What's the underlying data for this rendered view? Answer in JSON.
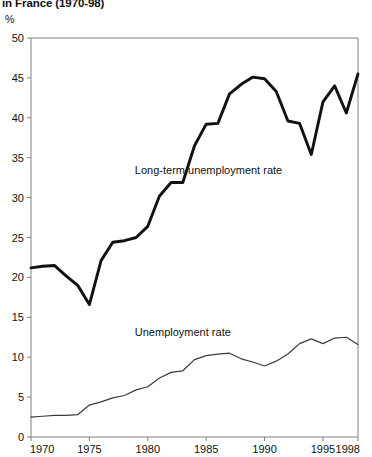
{
  "title": "in France (1970-98)",
  "axis_unit_label": "%",
  "chart_data": {
    "type": "line",
    "title": "in France (1970-98)",
    "xlabel": "",
    "ylabel": "%",
    "xlim": [
      1970,
      1998
    ],
    "ylim": [
      0,
      50
    ],
    "yticks": [
      0,
      5,
      10,
      15,
      20,
      25,
      30,
      35,
      40,
      45,
      50
    ],
    "xticks": [
      1970,
      1975,
      1980,
      1985,
      1990,
      1995,
      1998
    ],
    "xtick_labels": [
      "1970",
      "1975",
      "1980",
      "1985",
      "1990",
      "1995",
      "1998"
    ],
    "ytick_labels": [
      "0",
      "5",
      "10",
      "15",
      "20",
      "25",
      "30",
      "35",
      "40",
      "45",
      "50"
    ],
    "grid": false,
    "legend": "inline-annotations",
    "x": [
      1970,
      1971,
      1972,
      1973,
      1974,
      1975,
      1976,
      1977,
      1978,
      1979,
      1980,
      1981,
      1982,
      1983,
      1984,
      1985,
      1986,
      1987,
      1988,
      1989,
      1990,
      1991,
      1992,
      1993,
      1994,
      1995,
      1996,
      1997,
      1998
    ],
    "series": [
      {
        "name": "Long-term unemployment rate",
        "color": "#111111",
        "width": 2.9,
        "label_x": 1985.2,
        "label_y": 33.0,
        "values": [
          21.2,
          21.4,
          21.5,
          20.2,
          19.0,
          16.6,
          22.1,
          24.4,
          24.6,
          25.0,
          26.4,
          30.2,
          31.9,
          31.9,
          36.5,
          39.2,
          39.3,
          43.0,
          44.2,
          45.1,
          44.9,
          43.3,
          39.6,
          39.3,
          35.4,
          42.0,
          44.0,
          40.6,
          45.5
        ]
      },
      {
        "name": "Unemployment rate",
        "color": "#3c3c3c",
        "width": 1.25,
        "label_x": 1983.0,
        "label_y": 12.6,
        "values": [
          2.5,
          2.6,
          2.7,
          2.7,
          2.8,
          4.0,
          4.4,
          4.9,
          5.2,
          5.9,
          6.3,
          7.4,
          8.1,
          8.3,
          9.7,
          10.2,
          10.4,
          10.5,
          9.8,
          9.4,
          8.9,
          9.5,
          10.4,
          11.7,
          12.3,
          11.7,
          12.4,
          12.5,
          11.6
        ]
      }
    ],
    "annotations": [
      {
        "text": "Long-term unemployment rate",
        "x": 1985.2,
        "y": 33.0
      },
      {
        "text": "Unemployment rate",
        "x": 1983.0,
        "y": 12.6
      }
    ]
  }
}
